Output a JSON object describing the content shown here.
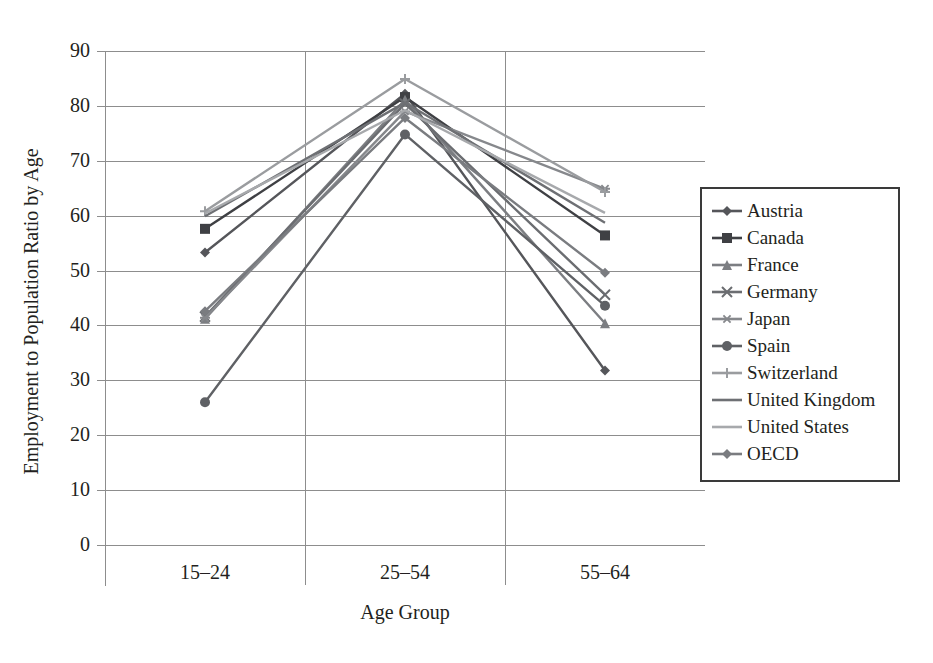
{
  "chart_data": {
    "type": "line",
    "title": "",
    "xlabel": "Age Group",
    "ylabel": "Employment to Population Ratio by Age",
    "categories": [
      "15–24",
      "25–54",
      "55–64"
    ],
    "ylim": [
      0,
      90
    ],
    "yticks": [
      0,
      10,
      20,
      30,
      40,
      50,
      60,
      70,
      80,
      90
    ],
    "ytick_labels": [
      "0",
      "10",
      "20",
      "30",
      "40",
      "50",
      "60",
      "70",
      "80",
      "90"
    ],
    "grid": true,
    "legend_position": "right",
    "series": [
      {
        "name": "Austria",
        "marker": "diamond",
        "color": "#55565a",
        "values": [
          53.3,
          82.2,
          31.8
        ]
      },
      {
        "name": "Canada",
        "marker": "square",
        "color": "#3f4044",
        "values": [
          57.6,
          81.6,
          56.4
        ]
      },
      {
        "name": "France",
        "marker": "triangle",
        "color": "#7c7e82",
        "values": [
          41.2,
          81.1,
          40.4
        ]
      },
      {
        "name": "Germany",
        "marker": "x",
        "color": "#6b6d71",
        "values": [
          41.6,
          80.4,
          45.6
        ]
      },
      {
        "name": "Japan",
        "marker": "asterisk",
        "color": "#86888c",
        "values": [
          41.4,
          79.0,
          64.9
        ]
      },
      {
        "name": "Spain",
        "marker": "circle",
        "color": "#5f6165",
        "values": [
          26.0,
          74.8,
          43.6
        ]
      },
      {
        "name": "Switzerland",
        "marker": "plus",
        "color": "#9a9c9f",
        "values": [
          60.8,
          84.9,
          64.3
        ]
      },
      {
        "name": "United Kingdom",
        "marker": "none",
        "color": "#6e7074",
        "values": [
          59.9,
          80.6,
          58.7
        ]
      },
      {
        "name": "United States",
        "marker": "none",
        "color": "#a7a9ac",
        "values": [
          60.4,
          79.2,
          60.5
        ]
      },
      {
        "name": "OECD",
        "marker": "diamond",
        "color": "#7a7c80",
        "values": [
          42.6,
          77.8,
          49.6
        ]
      }
    ]
  },
  "legend": {
    "items": [
      {
        "label": "Austria"
      },
      {
        "label": "Canada"
      },
      {
        "label": "France"
      },
      {
        "label": "Germany"
      },
      {
        "label": "Japan"
      },
      {
        "label": "Spain"
      },
      {
        "label": "Switzerland"
      },
      {
        "label": "United Kingdom"
      },
      {
        "label": "United States"
      },
      {
        "label": "OECD"
      }
    ]
  }
}
